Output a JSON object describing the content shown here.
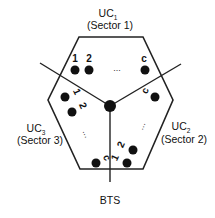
{
  "diagram": {
    "colors": {
      "stroke": "#222222",
      "dot": "#111111",
      "text": "#111111",
      "background": "#ffffff"
    },
    "sectors": [
      {
        "id": "UC1",
        "label_main": "UC",
        "label_sub": "1",
        "label_sector": "(Sector 1)",
        "user_labels": [
          "1",
          "2",
          "c"
        ],
        "ellipsis": "..."
      },
      {
        "id": "UC2",
        "label_main": "UC",
        "label_sub": "2",
        "label_sector": "(Sector 2)",
        "user_labels": [
          "1",
          "2",
          "c"
        ],
        "ellipsis": "..."
      },
      {
        "id": "UC3",
        "label_main": "UC",
        "label_sub": "3",
        "label_sector": "(Sector 3)",
        "user_labels": [
          "1",
          "2",
          "c"
        ],
        "ellipsis": "..."
      }
    ],
    "bts_label": "BTS"
  }
}
